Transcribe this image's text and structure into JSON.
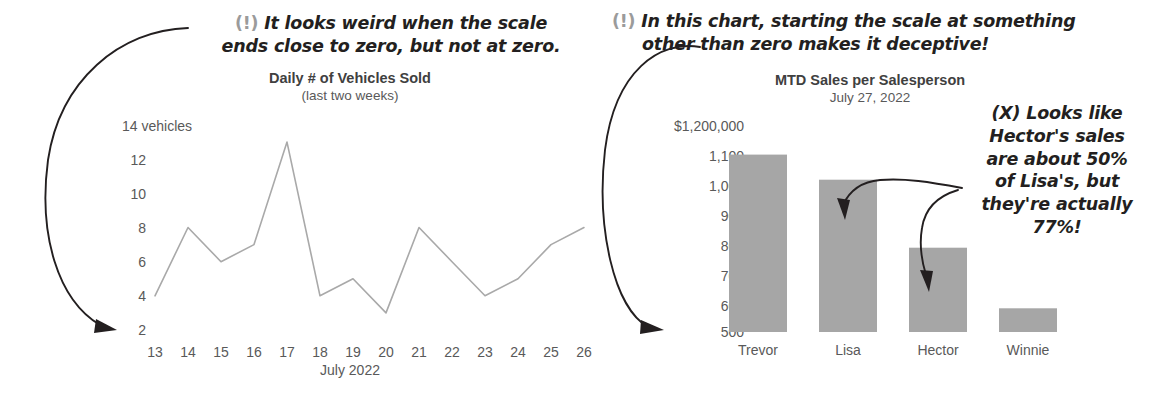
{
  "page": {
    "background": "#ffffff",
    "width": 1165,
    "height": 402
  },
  "annotations": {
    "left": {
      "marker": "(!)",
      "line1_a": " It looks weird when the scale",
      "line2_a": "ends ",
      "line2_em1": "close",
      "line2_b": " to zero, but not ",
      "line2_em2": "at",
      "line2_c": " zero.",
      "full_text": "(!) It looks weird when the scale ends close to zero, but not at zero."
    },
    "right": {
      "marker": "(!)",
      "line1": " In this chart, starting the scale at something",
      "line2": "other than zero makes it deceptive!",
      "full_text": "(!) In this chart, starting the scale at something other than zero makes it deceptive!"
    },
    "hector": {
      "marker": "(X)",
      "line1": "(X) Looks like",
      "line2": "Hector's sales",
      "line3": "are about 50%",
      "line4": "of Lisa's, but",
      "line5": "they're actually",
      "line6": "77%!",
      "full_text": "(X) Looks like Hector's sales are about 50% of Lisa's, but they're actually 77%!"
    }
  },
  "colors": {
    "bar_fill": "#a6a6a6",
    "line_stroke": "#a9a9a9",
    "axis_text": "#595959",
    "title_text": "#404040",
    "anno_text": "#231f20",
    "anno_marker": "#9b9b9b"
  },
  "chart_data": [
    {
      "type": "line",
      "title": "Daily # of Vehicles Sold",
      "subtitle": "(last two weeks)",
      "xlabel": "July 2022",
      "ylabel": "",
      "y_unit_label": "14 vehicles",
      "x": [
        13,
        14,
        15,
        16,
        17,
        18,
        19,
        20,
        21,
        22,
        23,
        24,
        25,
        26
      ],
      "xticklabels": [
        "13",
        "14",
        "15",
        "16",
        "17",
        "18",
        "19",
        "20",
        "21",
        "22",
        "23",
        "24",
        "25",
        "26"
      ],
      "values": [
        4,
        8,
        6,
        7,
        13,
        4,
        5,
        3,
        8,
        6,
        4,
        5,
        7,
        8
      ],
      "yticks": [
        14,
        12,
        10,
        8,
        6,
        4,
        2
      ],
      "yticklabels": [
        "14 vehicles",
        "12",
        "10",
        "8",
        "6",
        "4",
        "2"
      ],
      "ylim": [
        2,
        14
      ],
      "grid": false,
      "legend": false
    },
    {
      "type": "bar",
      "title": "MTD Sales per Salesperson",
      "subtitle": "July 27, 2022",
      "xlabel": "",
      "ylabel": "",
      "categories": [
        "Trevor",
        "Lisa",
        "Hector",
        "Winnie"
      ],
      "values": [
        1100000,
        1015000,
        785000,
        580000
      ],
      "value_labels_thousands": [
        "1,100",
        "1,015",
        "785",
        "580"
      ],
      "yticks": [
        1200000,
        1100000,
        1000000,
        900000,
        800000,
        700000,
        600000,
        500000
      ],
      "yticklabels": [
        "$1,200,000",
        "1,100",
        "1,000",
        "900",
        "800",
        "700",
        "600",
        "500"
      ],
      "ylim": [
        500000,
        1200000
      ],
      "grid": false,
      "legend": false
    }
  ],
  "line_chart_ticks": {
    "y": [
      {
        "label": "14 vehicles",
        "value": 14
      },
      {
        "label": "12",
        "value": 12
      },
      {
        "label": "10",
        "value": 10
      },
      {
        "label": "8",
        "value": 8
      },
      {
        "label": "6",
        "value": 6
      },
      {
        "label": "4",
        "value": 4
      },
      {
        "label": "2",
        "value": 2
      }
    ],
    "x": [
      "13",
      "14",
      "15",
      "16",
      "17",
      "18",
      "19",
      "20",
      "21",
      "22",
      "23",
      "24",
      "25",
      "26"
    ]
  },
  "bar_chart_ticks": {
    "y": [
      "$1,200,000",
      "1,100",
      "1,000",
      "900",
      "800",
      "700",
      "600",
      "500"
    ],
    "x": [
      "Trevor",
      "Lisa",
      "Hector",
      "Winnie"
    ]
  }
}
